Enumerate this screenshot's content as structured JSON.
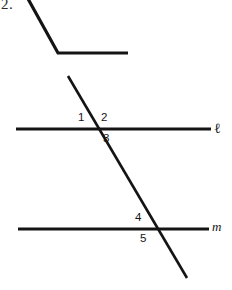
{
  "figure": {
    "problem_number": "2.",
    "background_color": "#ffffff",
    "stroke_color": "#141414",
    "canvas": {
      "width": 232,
      "height": 290
    },
    "bent_angle": {
      "name": "bent-ray-figure",
      "stroke_width": 3.2,
      "points": [
        {
          "x": 27,
          "y": -3
        },
        {
          "x": 58,
          "y": 53
        },
        {
          "x": 128,
          "y": 53
        }
      ]
    },
    "transversal": {
      "name": "transversal-line",
      "stroke_width": 2.6,
      "x1": 68,
      "y1": 76,
      "x2": 187,
      "y2": 278
    },
    "lines": [
      {
        "id": "line-ell",
        "label": "ℓ",
        "label_style": "script",
        "stroke_width": 2.8,
        "x1": 16,
        "y1": 129,
        "x2": 211,
        "y2": 129
      },
      {
        "id": "line-m",
        "label": "m",
        "label_style": "italic",
        "stroke_width": 2.8,
        "x1": 18,
        "y1": 229,
        "x2": 209,
        "y2": 229
      }
    ],
    "angle_labels": [
      {
        "id": "angle-1",
        "text": "1",
        "x": 78,
        "y": 112,
        "position": "upper-left of intersection with line ell"
      },
      {
        "id": "angle-2",
        "text": "2",
        "x": 101,
        "y": 112,
        "position": "upper-right of intersection with line ell"
      },
      {
        "id": "angle-3",
        "text": "3",
        "x": 103,
        "y": 133,
        "position": "lower-right of intersection with line ell"
      },
      {
        "id": "angle-4",
        "text": "4",
        "x": 135,
        "y": 212,
        "position": "upper-left of intersection with line m"
      },
      {
        "id": "angle-5",
        "text": "5",
        "x": 140,
        "y": 233,
        "position": "lower-left of intersection with line m"
      }
    ],
    "intersections": [
      {
        "id": "intersection-ell",
        "x": 96,
        "y": 129
      },
      {
        "id": "intersection-m",
        "x": 149,
        "y": 229
      }
    ]
  }
}
